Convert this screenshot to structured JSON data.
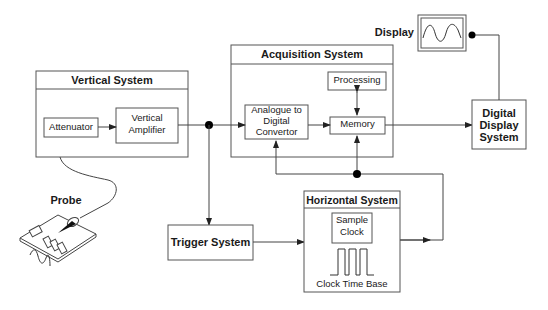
{
  "diagram": {
    "colors": {
      "stroke": "#555555",
      "text": "#1a1a1a",
      "background": "#ffffff",
      "dot": "#000000"
    },
    "vertical_system": {
      "title": "Vertical System",
      "attenuator": "Attenuator",
      "amplifier_line1": "Vertical",
      "amplifier_line2": "Amplifier"
    },
    "acquisition_system": {
      "title": "Acquisition System",
      "processing": "Processing",
      "adc_line1": "Analogue to",
      "adc_line2": "Digital",
      "adc_line3": "Convertor",
      "memory": "Memory"
    },
    "display": {
      "label": "Display"
    },
    "digital_display_system": {
      "line1": "Digital",
      "line2": "Display",
      "line3": "System"
    },
    "probe": {
      "label": "Probe"
    },
    "trigger_system": {
      "label": "Trigger System"
    },
    "horizontal_system": {
      "title": "Horizontal System",
      "sample_clock_line1": "Sample",
      "sample_clock_line2": "Clock",
      "clock_time_base": "Clock Time Base"
    }
  }
}
